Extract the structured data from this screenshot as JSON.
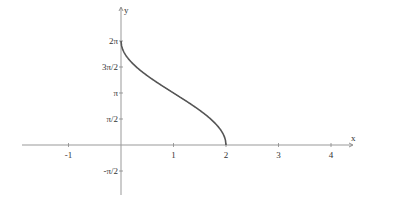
{
  "chart_data": {
    "type": "line",
    "title": "",
    "xlabel": "x",
    "ylabel": "y",
    "xlim": [
      -1.9,
      4.5
    ],
    "ylim": [
      -1.9,
      8.5
    ],
    "grid": false,
    "function": "y = 2·arccos(x − 1)",
    "x_ticks": [
      {
        "value": -1,
        "label": "-1"
      },
      {
        "value": 1,
        "label": "1"
      },
      {
        "value": 2,
        "label": "2"
      },
      {
        "value": 3,
        "label": "3"
      },
      {
        "value": 4,
        "label": "4"
      }
    ],
    "y_ticks": [
      {
        "value": 6.2832,
        "label": "2π"
      },
      {
        "value": 4.7124,
        "label": "3π/2"
      },
      {
        "value": 3.1416,
        "label": "π"
      },
      {
        "value": 1.5708,
        "label": "π/2"
      },
      {
        "value": -1.5708,
        "label": "-π/2"
      }
    ],
    "series": [
      {
        "name": "curve",
        "color": "#555555",
        "x": [
          0,
          0.05,
          0.1,
          0.25,
          0.5,
          0.75,
          1.0,
          1.25,
          1.5,
          1.75,
          1.9,
          1.95,
          2.0
        ],
        "y": [
          6.2832,
          5.9297,
          5.7843,
          5.4505,
          5.0265,
          4.6393,
          3.1416,
          2.6362,
          2.0944,
          1.4455,
          0.9021,
          0.6351,
          0
        ]
      }
    ],
    "axis_color": "#888888",
    "x_axis_label": "x",
    "y_axis_label": "y"
  }
}
